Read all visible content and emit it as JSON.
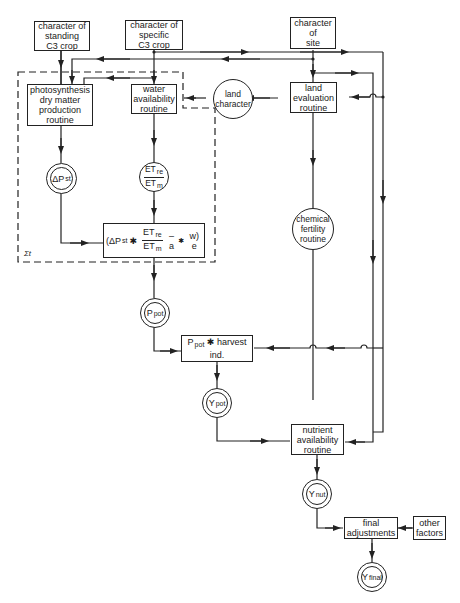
{
  "diagram": {
    "type": "flowchart",
    "title": "",
    "nodes": {
      "standing_crop": {
        "label": "character of\nstanding\nC3 crop",
        "shape": "box"
      },
      "specific_crop": {
        "label": "character of\nspecific\nC3 crop",
        "shape": "box"
      },
      "site": {
        "label": "character\nof\nsite",
        "shape": "box"
      },
      "photosynthesis": {
        "label": "photosynthesis\ndry matter\nproduction\nroutine",
        "shape": "box"
      },
      "water": {
        "label": "water\navailability\nroutine",
        "shape": "box"
      },
      "land_character": {
        "label": "land\ncharacter",
        "shape": "circle"
      },
      "land_evaluation": {
        "label": "land\nevaluation\nroutine",
        "shape": "box"
      },
      "delta_pst": {
        "main": "ΔP",
        "sub": "st",
        "shape": "double-circle"
      },
      "et_ratio": {
        "num_main": "ET",
        "num_sub": "re",
        "den_main": "ET",
        "den_sub": "m",
        "shape": "circle"
      },
      "formula": {
        "open": "(ΔP",
        "open_sub": "st",
        "op": "✱",
        "num_main": "ET",
        "num_sub": "re",
        "den_main": "ET",
        "den_sub": "m",
        "tail": "– a",
        "tail_sub": "✱",
        "tail2": "w) e",
        "shape": "box"
      },
      "chemical_fertility": {
        "label": "chemical\nfertility\nroutine",
        "shape": "circle"
      },
      "ppot": {
        "main": "P",
        "sub": "pot",
        "shape": "double-circle"
      },
      "harvest": {
        "main": "P",
        "sub": "pot",
        "rest": " ✱ harvest",
        "line2": "ind.",
        "shape": "box"
      },
      "ypot": {
        "main": "Y",
        "sub": "pot",
        "shape": "double-circle"
      },
      "nutrient": {
        "label": "nutrient\navailability\nroutine",
        "shape": "box"
      },
      "ynut": {
        "main": "Y",
        "sub": "nut",
        "shape": "double-circle"
      },
      "final_adjustments": {
        "label": "final\nadjustments",
        "shape": "box"
      },
      "other_factors": {
        "label": "other\nfactors",
        "shape": "box"
      },
      "yfinal": {
        "main": "Y",
        "sub": "final",
        "shape": "double-circle"
      }
    },
    "loop_label": "Σt",
    "edges": [
      [
        "standing_crop",
        "photosynthesis"
      ],
      [
        "specific_crop",
        "photosynthesis"
      ],
      [
        "specific_crop",
        "water"
      ],
      [
        "specific_crop",
        "land_evaluation"
      ],
      [
        "specific_crop",
        "nutrient"
      ],
      [
        "site",
        "photosynthesis"
      ],
      [
        "site",
        "land_evaluation"
      ],
      [
        "site",
        "nutrient"
      ],
      [
        "site",
        "harvest"
      ],
      [
        "land_evaluation",
        "land_character"
      ],
      [
        "land_character",
        "water"
      ],
      [
        "land_evaluation",
        "chemical_fertility"
      ],
      [
        "photosynthesis",
        "delta_pst"
      ],
      [
        "water",
        "et_ratio"
      ],
      [
        "delta_pst",
        "formula"
      ],
      [
        "et_ratio",
        "formula"
      ],
      [
        "formula",
        "ppot"
      ],
      [
        "ppot",
        "harvest"
      ],
      [
        "harvest",
        "ypot"
      ],
      [
        "ypot",
        "nutrient"
      ],
      [
        "chemical_fertility",
        "nutrient"
      ],
      [
        "nutrient",
        "ynut"
      ],
      [
        "ynut",
        "final_adjustments"
      ],
      [
        "other_factors",
        "final_adjustments"
      ],
      [
        "final_adjustments",
        "yfinal"
      ]
    ]
  }
}
